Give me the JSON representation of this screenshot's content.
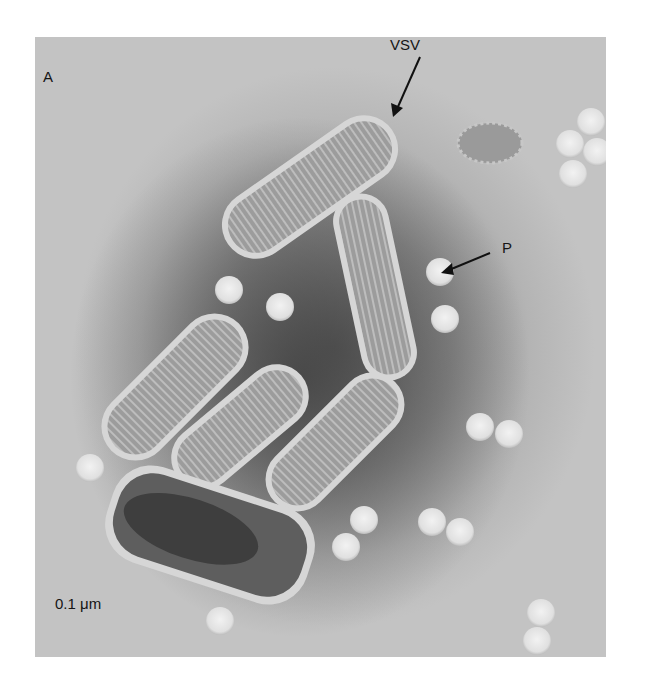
{
  "figure": {
    "panel_label": "A",
    "annotations": {
      "vsv": "VSV",
      "p": "P"
    },
    "scale_bar": "0.1 μm"
  },
  "colors": {
    "background": "#c3c3c3",
    "virion_body": "#9a9a9a",
    "virion_edge": "#d8d8d8",
    "particle": "#e6e6e6",
    "stain_dark": "#4a4a4a"
  }
}
